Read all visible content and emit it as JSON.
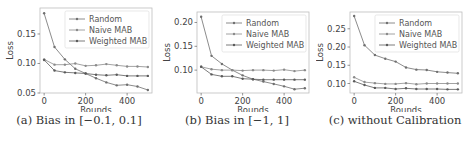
{
  "chart_data": [
    {
      "type": "line",
      "title": "",
      "caption": "(a) Bias in [−0.1, 0.1]",
      "xlabel": "Rounds",
      "ylabel": "Loss",
      "x": [
        0,
        50,
        100,
        150,
        200,
        250,
        300,
        350,
        400,
        450,
        500
      ],
      "xticks": [
        0,
        200,
        400
      ],
      "yticks": [
        0.05,
        0.1,
        0.15
      ],
      "ytick_labels": [
        "0.05",
        "0.10",
        "0.15"
      ],
      "xlim": [
        -20,
        520
      ],
      "ylim": [
        0.05,
        0.194
      ],
      "grid": false,
      "legend_position": "upper right",
      "series": [
        {
          "name": "Random",
          "values": [
            0.185,
            0.128,
            0.107,
            0.091,
            0.083,
            0.075,
            0.068,
            0.063,
            0.064,
            0.061,
            0.055
          ]
        },
        {
          "name": "Naive MAB",
          "values": [
            0.107,
            0.098,
            0.098,
            0.1,
            0.096,
            0.097,
            0.099,
            0.097,
            0.095,
            0.095,
            0.094
          ]
        },
        {
          "name": "Weighted MAB",
          "values": [
            0.106,
            0.088,
            0.085,
            0.084,
            0.083,
            0.081,
            0.08,
            0.081,
            0.079,
            0.079,
            0.079
          ]
        }
      ]
    },
    {
      "type": "line",
      "title": "",
      "caption": "(b) Bias in [−1, 1]",
      "xlabel": "Rounds",
      "ylabel": "Loss",
      "x": [
        0,
        50,
        100,
        150,
        200,
        250,
        300,
        350,
        400,
        450,
        500
      ],
      "xticks": [
        0,
        200,
        400
      ],
      "yticks": [
        0.1,
        0.15,
        0.2
      ],
      "ytick_labels": [
        "0.10",
        "0.15",
        "0.20"
      ],
      "xlim": [
        -20,
        520
      ],
      "ylim": [
        0.052,
        0.222
      ],
      "grid": false,
      "legend_position": "upper right",
      "series": [
        {
          "name": "Random",
          "values": [
            0.212,
            0.13,
            0.113,
            0.1,
            0.089,
            0.081,
            0.076,
            0.071,
            0.066,
            0.06,
            0.062
          ]
        },
        {
          "name": "Naive MAB",
          "values": [
            0.107,
            0.102,
            0.1,
            0.1,
            0.099,
            0.1,
            0.1,
            0.099,
            0.101,
            0.098,
            0.1
          ]
        },
        {
          "name": "Weighted MAB",
          "values": [
            0.107,
            0.091,
            0.087,
            0.087,
            0.082,
            0.081,
            0.08,
            0.08,
            0.08,
            0.08,
            0.08
          ]
        }
      ]
    },
    {
      "type": "line",
      "title": "",
      "caption": "(c) without Calibration",
      "xlabel": "Rounds",
      "ylabel": "Loss",
      "x": [
        0,
        50,
        100,
        150,
        200,
        250,
        300,
        350,
        400,
        450,
        500
      ],
      "xticks": [
        0,
        200,
        400
      ],
      "yticks": [
        0.1,
        0.15,
        0.2,
        0.25
      ],
      "ytick_labels": [
        "0.10",
        "0.15",
        "0.20",
        "0.25"
      ],
      "xlim": [
        -20,
        520
      ],
      "ylim": [
        0.074,
        0.296
      ],
      "grid": false,
      "legend_position": "upper right",
      "series": [
        {
          "name": "Random",
          "values": [
            0.285,
            0.205,
            0.178,
            0.168,
            0.16,
            0.144,
            0.138,
            0.137,
            0.132,
            0.13,
            0.128
          ]
        },
        {
          "name": "Naive MAB",
          "values": [
            0.117,
            0.104,
            0.101,
            0.099,
            0.099,
            0.101,
            0.098,
            0.1,
            0.1,
            0.1,
            0.1
          ]
        },
        {
          "name": "Weighted MAB",
          "values": [
            0.106,
            0.096,
            0.088,
            0.088,
            0.085,
            0.087,
            0.085,
            0.085,
            0.085,
            0.084,
            0.084
          ]
        }
      ]
    }
  ],
  "style": {
    "line_colors": [
      "#6f6f6f",
      "#8a8a8a",
      "#5a5a5a"
    ],
    "axis_color": "#bdbdbd",
    "text_color": "#444444"
  }
}
